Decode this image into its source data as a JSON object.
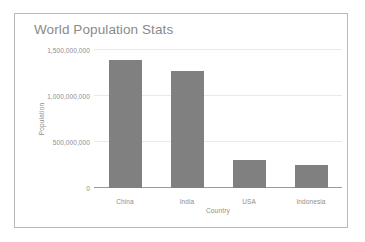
{
  "chart_data": {
    "type": "bar",
    "title": "World Population Stats",
    "xlabel": "Country",
    "ylabel": "Population",
    "categories": [
      "China",
      "India",
      "USA",
      "Indonesia"
    ],
    "values": [
      1390000000,
      1270000000,
      300000000,
      250000000
    ],
    "ylim": [
      0,
      1500000000
    ],
    "yticks": [
      0,
      500000000,
      1000000000,
      1500000000
    ],
    "ytick_labels": [
      "0",
      "500,000,000",
      "1,000,000,000",
      "1,500,000,000"
    ],
    "grid": true,
    "legend": "none",
    "bar_color": "#808080",
    "gridline_color": "#e9e9e9",
    "axis_color": "#9a9a9a",
    "text_color": "#8d8d8d",
    "title_color": "#8a8a8a",
    "border_color": "#b9b9b9",
    "background": "#ffffff"
  }
}
